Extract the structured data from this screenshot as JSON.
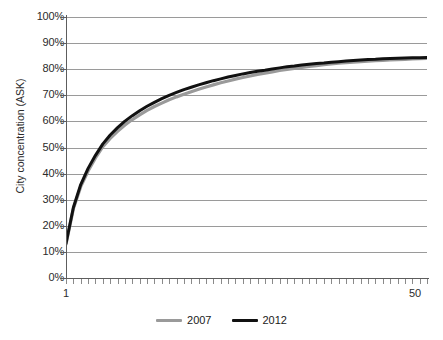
{
  "chart_data": {
    "type": "line",
    "title": "",
    "xlabel": "",
    "ylabel": "City concentration (ASK)",
    "xlim": [
      1,
      50
    ],
    "ylim": [
      0,
      1
    ],
    "grid": true,
    "legend_position": "bottom-center",
    "x_tick_labels": [
      "1",
      "50"
    ],
    "y_tick_labels": [
      "0%",
      "10%",
      "20%",
      "30%",
      "40%",
      "50%",
      "60%",
      "70%",
      "80%",
      "90%",
      "100%"
    ],
    "y_tick_values": [
      0,
      10,
      20,
      30,
      40,
      50,
      60,
      70,
      80,
      90,
      100
    ],
    "x": [
      1,
      2,
      3,
      4,
      5,
      6,
      7,
      8,
      9,
      10,
      11,
      12,
      13,
      14,
      15,
      16,
      17,
      18,
      19,
      20,
      21,
      22,
      23,
      24,
      25,
      26,
      27,
      28,
      29,
      30,
      31,
      32,
      33,
      34,
      35,
      36,
      37,
      38,
      39,
      40,
      41,
      42,
      43,
      44,
      45,
      46,
      47,
      48,
      49,
      50
    ],
    "series": [
      {
        "name": "2007",
        "color": "#9a9a9a",
        "values": [
          13.0,
          26.5,
          35.0,
          41.0,
          46.0,
          50.3,
          53.5,
          56.2,
          58.6,
          60.7,
          62.5,
          64.2,
          65.7,
          67.0,
          68.3,
          69.4,
          70.4,
          71.4,
          72.3,
          73.2,
          74.0,
          74.8,
          75.5,
          76.2,
          76.8,
          77.4,
          78.0,
          78.5,
          79.0,
          79.5,
          79.9,
          80.3,
          80.7,
          81.1,
          81.4,
          81.7,
          82.0,
          82.3,
          82.5,
          82.7,
          82.9,
          83.1,
          83.3,
          83.4,
          83.6,
          83.7,
          83.8,
          83.9,
          84.0,
          84.1
        ]
      },
      {
        "name": "2012",
        "color": "#111111",
        "values": [
          13.2,
          27.0,
          35.8,
          42.0,
          47.0,
          51.4,
          54.8,
          57.6,
          60.1,
          62.2,
          64.1,
          65.8,
          67.3,
          68.7,
          70.0,
          71.1,
          72.2,
          73.1,
          74.0,
          74.8,
          75.6,
          76.3,
          77.0,
          77.6,
          78.2,
          78.7,
          79.2,
          79.6,
          80.1,
          80.5,
          80.9,
          81.2,
          81.6,
          81.9,
          82.2,
          82.4,
          82.7,
          82.9,
          83.1,
          83.3,
          83.5,
          83.7,
          83.8,
          84.0,
          84.1,
          84.2,
          84.3,
          84.4,
          84.4,
          84.5
        ]
      }
    ]
  },
  "legend": {
    "items": [
      {
        "label": "2007"
      },
      {
        "label": "2012"
      }
    ]
  },
  "axes": {
    "y_title": "City concentration (ASK)",
    "x_min_label": "1",
    "x_max_label": "50"
  }
}
